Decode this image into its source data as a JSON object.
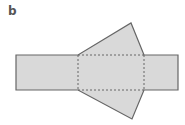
{
  "figure": {
    "panel_label": "b",
    "colors": {
      "fill": "#d9d9d9",
      "stroke": "#666666",
      "fold_line": "#666666",
      "background": "#ffffff"
    },
    "shapes": {
      "left_rectangle": {
        "x": 16,
        "y": 55,
        "width": 62,
        "height": 35
      },
      "middle_rectangle": {
        "x": 78,
        "y": 55,
        "width": 66,
        "height": 35,
        "style": "dashed"
      },
      "right_rectangle": {
        "x": 144,
        "y": 55,
        "width": 34,
        "height": 35
      },
      "top_triangle": {
        "points": [
          [
            78,
            55
          ],
          [
            131,
            23
          ],
          [
            144,
            55
          ]
        ]
      },
      "bottom_triangle": {
        "points": [
          [
            78,
            90
          ],
          [
            132,
            119
          ],
          [
            144,
            90
          ]
        ]
      }
    }
  }
}
